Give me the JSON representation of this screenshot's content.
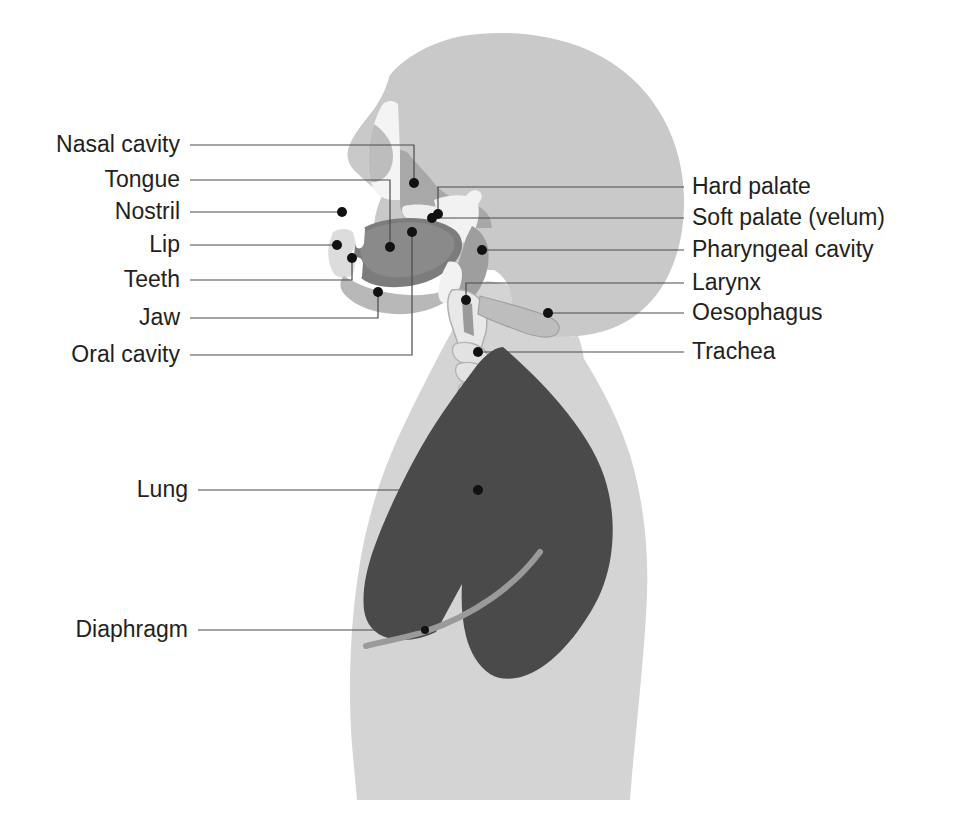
{
  "figure": {
    "background_color": "#ffffff"
  },
  "colors": {
    "body_silhouette": "#d4d4d4",
    "head_fill": "#c9c9c9",
    "tissue_mid": "#a8a8a8",
    "tissue_dark": "#8a8a8a",
    "oral_cavity": "#7c7c7c",
    "cavity_white": "#f2f2f2",
    "lung": "#4a4a4a",
    "diaphragm": "#9a9a9a",
    "leader_line": "#4a4a4a",
    "dot": "#111111",
    "text": "#231f20"
  },
  "labels_left": [
    {
      "id": "nasal-cavity",
      "text": "Nasal cavity",
      "text_x": 180,
      "text_y": 152,
      "path": "M 190 145 L 414 145 L 414 183",
      "dot_x": 414,
      "dot_y": 183
    },
    {
      "id": "tongue",
      "text": "Tongue",
      "text_x": 180,
      "text_y": 187,
      "path": "M 190 180 L 390 180 L 390 247",
      "dot_x": 390,
      "dot_y": 247
    },
    {
      "id": "nostril",
      "text": "Nostril",
      "text_x": 180,
      "text_y": 219,
      "path": "M 190 212 L 342 212",
      "dot_x": 342,
      "dot_y": 212
    },
    {
      "id": "lip",
      "text": "Lip",
      "text_x": 180,
      "text_y": 252,
      "path": "M 190 245 L 337 245",
      "dot_x": 337,
      "dot_y": 245
    },
    {
      "id": "teeth",
      "text": "Teeth",
      "text_x": 180,
      "text_y": 287,
      "path": "M 190 280 L 352 280 L 352 258",
      "dot_x": 352,
      "dot_y": 258
    },
    {
      "id": "jaw",
      "text": "Jaw",
      "text_x": 180,
      "text_y": 325,
      "path": "M 190 318 L 378 318 L 378 292",
      "dot_x": 378,
      "dot_y": 292
    },
    {
      "id": "oral-cavity",
      "text": "Oral cavity",
      "text_x": 180,
      "text_y": 362,
      "path": "M 190 355 L 412 355 L 412 232",
      "dot_x": 412,
      "dot_y": 232
    },
    {
      "id": "lung",
      "text": "Lung",
      "text_x": 188,
      "text_y": 497,
      "path": "M 198 490 L 478 490",
      "dot_x": 478,
      "dot_y": 490
    },
    {
      "id": "diaphragm",
      "text": "Diaphragm",
      "text_x": 188,
      "text_y": 637,
      "path": "M 198 630 L 425 630",
      "dot_x": 425,
      "dot_y": 630
    }
  ],
  "labels_right": [
    {
      "id": "hard-palate",
      "text": "Hard palate",
      "text_x": 692,
      "text_y": 194,
      "path": "M 684 187 L 438 187 L 438 214",
      "dot_x": 438,
      "dot_y": 214
    },
    {
      "id": "soft-palate",
      "text": "Soft palate (velum)",
      "text_x": 692,
      "text_y": 225,
      "path": "M 684 218 L 432 218",
      "dot_x": 432,
      "dot_y": 218
    },
    {
      "id": "pharyngeal-cavity",
      "text": "Pharyngeal cavity",
      "text_x": 692,
      "text_y": 257,
      "path": "M 684 250 L 482 250",
      "dot_x": 482,
      "dot_y": 250
    },
    {
      "id": "larynx",
      "text": "Larynx",
      "text_x": 692,
      "text_y": 290,
      "path": "M 684 283 L 466 283 L 466 300",
      "dot_x": 466,
      "dot_y": 300
    },
    {
      "id": "oesophagus",
      "text": "Oesophagus",
      "text_x": 692,
      "text_y": 320,
      "path": "M 684 313 L 548 313",
      "dot_x": 548,
      "dot_y": 313
    },
    {
      "id": "trachea",
      "text": "Trachea",
      "text_x": 692,
      "text_y": 359,
      "path": "M 684 352 L 478 352",
      "dot_x": 478,
      "dot_y": 352
    }
  ],
  "anatomy_parts": [
    {
      "name": "body-silhouette",
      "description": "Head, neck, shoulders and torso outline"
    },
    {
      "name": "skull-and-face",
      "description": "Cranium and facial profile"
    },
    {
      "name": "nasal-cavity",
      "description": "Nasal passage above the hard palate"
    },
    {
      "name": "hard-palate",
      "description": "Bony roof of the mouth"
    },
    {
      "name": "soft-palate",
      "description": "Velum, the soft rear roof of the mouth"
    },
    {
      "name": "tongue",
      "description": "Muscular organ filling the oral cavity"
    },
    {
      "name": "oral-cavity",
      "description": "Mouth cavity"
    },
    {
      "name": "teeth",
      "description": "Upper and lower incisors"
    },
    {
      "name": "lip",
      "description": "Upper and lower lips"
    },
    {
      "name": "jaw",
      "description": "Mandible"
    },
    {
      "name": "pharyngeal-cavity",
      "description": "Throat cavity behind tongue"
    },
    {
      "name": "larynx",
      "description": "Voice box with vocal folds"
    },
    {
      "name": "oesophagus",
      "description": "Food pipe running behind the trachea"
    },
    {
      "name": "trachea",
      "description": "Windpipe with cartilage rings"
    },
    {
      "name": "lung",
      "description": "Right lung, dark grey"
    },
    {
      "name": "diaphragm",
      "description": "Muscular sheet beneath the lung"
    }
  ]
}
